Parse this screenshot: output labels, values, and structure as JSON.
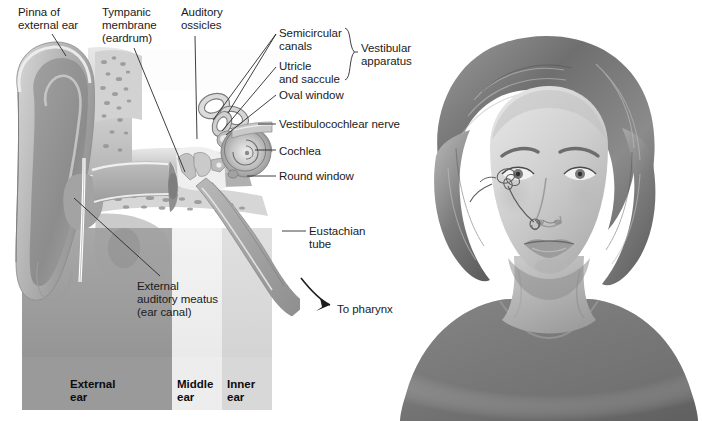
{
  "figure": {
    "background_color": "#ffffff",
    "text_color": "#1b1b1b",
    "leader_color": "#2a2a2a"
  },
  "labels": [
    {
      "id": "pinna",
      "name": "label-pinna-of-external-ear",
      "text": "Pinna of\nexternal ear",
      "x": 18,
      "y": 6,
      "align": "left"
    },
    {
      "id": "tympanic",
      "name": "label-tympanic-membrane",
      "text": "Tympanic\nmembrane\n(eardrum)",
      "x": 102,
      "y": 6,
      "align": "left"
    },
    {
      "id": "ossicles",
      "name": "label-auditory-ossicles",
      "text": "Auditory\nossicles",
      "x": 181,
      "y": 6,
      "align": "left"
    },
    {
      "id": "semicircular",
      "name": "label-semicircular-canals",
      "text": "Semicircular\ncanals",
      "x": 279,
      "y": 27,
      "align": "left"
    },
    {
      "id": "utricle",
      "name": "label-utricle-and-saccule",
      "text": "Utricle\nand saccule",
      "x": 279,
      "y": 60,
      "align": "left"
    },
    {
      "id": "vestibular",
      "name": "label-vestibular-apparatus",
      "text": "Vestibular\napparatus",
      "x": 361,
      "y": 42,
      "align": "left"
    },
    {
      "id": "ovalwindow",
      "name": "label-oval-window",
      "text": "Oval window",
      "x": 279,
      "y": 89,
      "align": "left"
    },
    {
      "id": "vestibulo",
      "name": "label-vestibulocochlear-nerve",
      "text": "Vestibulocochlear nerve",
      "x": 279,
      "y": 118,
      "align": "left"
    },
    {
      "id": "cochlea",
      "name": "label-cochlea",
      "text": "Cochlea",
      "x": 279,
      "y": 145,
      "align": "left"
    },
    {
      "id": "roundwindow",
      "name": "label-round-window",
      "text": "Round window",
      "x": 279,
      "y": 170,
      "align": "left"
    },
    {
      "id": "eustachian",
      "name": "label-eustachian-tube",
      "text": "Eustachian\ntube",
      "x": 309,
      "y": 225,
      "align": "left"
    },
    {
      "id": "meatus",
      "name": "label-external-auditory-meatus",
      "text": "External\nauditory meatus\n(ear canal)",
      "x": 137,
      "y": 280,
      "align": "left"
    },
    {
      "id": "pharynx",
      "name": "label-to-pharynx",
      "text": "To pharynx",
      "x": 337,
      "y": 303,
      "align": "left"
    }
  ],
  "leaders": [
    {
      "name": "leader-pinna",
      "points": "52,34 66,56"
    },
    {
      "name": "leader-tympanic",
      "points": "134,48 185,172"
    },
    {
      "name": "leader-ossicles",
      "points": "195,36 197,139"
    },
    {
      "name": "leader-semicircular",
      "points": "276,34 228,113"
    },
    {
      "name": "leader-semicircular-2",
      "points": "276,34 213,120"
    },
    {
      "name": "leader-utricle",
      "points": "276,67 222,131"
    },
    {
      "name": "leader-oval-window",
      "points": "276,95 226,135"
    },
    {
      "name": "leader-vestibulocochlear-nerve",
      "points": "276,124 258,124"
    },
    {
      "name": "leader-cochlea",
      "points": "276,150 255,150"
    },
    {
      "name": "leader-round-window",
      "points": "276,176 247,176"
    },
    {
      "name": "leader-eustachian",
      "points": "306,231 282,231"
    },
    {
      "name": "leader-meatus",
      "points": "74,198 160,276"
    }
  ],
  "brace": {
    "name": "vestibular-apparatus-brace",
    "x": 345,
    "y_top": 28,
    "y_bottom": 80,
    "width": 12
  },
  "pharynx_arrow": {
    "name": "to-pharynx-arrow",
    "path": "M 301,278 C 312,292 320,300 330,305"
  },
  "region_band": {
    "name": "ear-region-band",
    "x": 22,
    "y": 357,
    "width": 250,
    "height": 53,
    "segments": [
      {
        "name": "band-segment-external",
        "label": "External\near",
        "color": "#9a9a9a",
        "start": 0,
        "width": 150,
        "text_x": 48,
        "text_y": 21
      },
      {
        "name": "band-segment-middle",
        "label": "Middle\near",
        "color": "#ededed",
        "start": 150,
        "width": 50,
        "text_x": 5,
        "text_y": 21
      },
      {
        "name": "band-segment-inner",
        "label": "Inner\near",
        "color": "#d8d8d8",
        "start": 200,
        "width": 50,
        "text_x": 5,
        "text_y": 21
      }
    ]
  },
  "ear_illustration": {
    "name": "ear-cross-section-illustration",
    "description": "Grayscale cutaway of the external, middle and inner ear",
    "x": 0,
    "y": 40,
    "width": 300,
    "height": 370
  },
  "portrait": {
    "name": "woman-head-portrait",
    "description": "Grayscale portrait of a woman's head and shoulders with inner-ear structures shown in place",
    "x": 396,
    "y": 8,
    "width": 306,
    "height": 413
  }
}
